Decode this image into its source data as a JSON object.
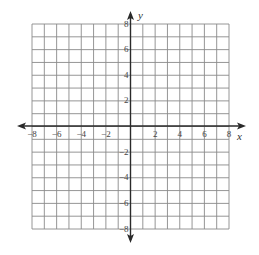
{
  "diagram": {
    "type": "coordinate-plane",
    "x_axis": {
      "label": "x",
      "min": -8,
      "max": 8,
      "grid_step": 1,
      "tick_labels": [
        "−8",
        "−6",
        "−4",
        "−2",
        "2",
        "4",
        "6",
        "8"
      ],
      "tick_values": [
        -8,
        -6,
        -4,
        -2,
        2,
        4,
        6,
        8
      ]
    },
    "y_axis": {
      "label": "y",
      "min": -8,
      "max": 8,
      "grid_step": 1,
      "tick_labels": [
        "8",
        "6",
        "4",
        "2",
        "−2",
        "−4",
        "−6",
        "−8"
      ],
      "tick_values": [
        8,
        6,
        4,
        2,
        -2,
        -4,
        -6,
        -8
      ]
    },
    "colors": {
      "grid": "#8a8a8a",
      "axis": "#2a2a2a",
      "label": "#444444",
      "background": "#ffffff"
    }
  }
}
